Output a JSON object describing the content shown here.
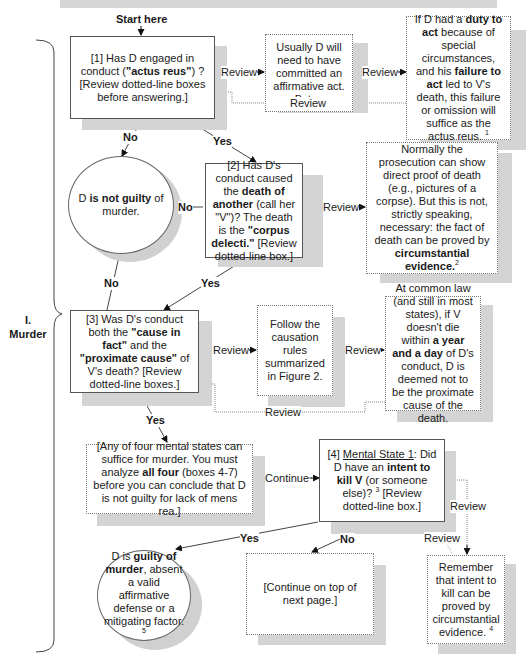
{
  "section": {
    "number": "I.",
    "title": "Murder"
  },
  "start_label": "Start here",
  "nodes": {
    "q1": {
      "pre": "[1] Has D engaged in conduct (",
      "bold": "\"actus reus\"",
      "post": ") ? [Review dotted-line boxes before answering.]"
    },
    "note_affirmative": {
      "text": "Usually D will need to have committed an affirmative act. But ..."
    },
    "note_duty": {
      "t1": "If D had a ",
      "b1": "duty to act",
      "t2": " because of special circumstances, and his ",
      "b2": "failure to act",
      "t3": " led to V's death, this failure or omission will suffice as the actus reus.",
      "footnote": "1"
    },
    "not_guilty": {
      "t1": "D ",
      "b1": "is not guilty",
      "t2": " of murder."
    },
    "q2": {
      "t1": "[2] Has D's conduct caused the ",
      "b1": "death of another",
      "t2": " (call her \"V\")? The death is the ",
      "b2": "\"corpus delecti.\"",
      "t3": "  [Review dotted-line box.]"
    },
    "note_corpus": {
      "t1": "Normally the prosecution can show direct proof of death (e.g., pictures of a corpse). But this is not, strictly speaking, necessary: the fact of death can be proved by ",
      "b1": "circumstantial evidence.",
      "footnote": "2"
    },
    "q3": {
      "t1": "[3] Was D's conduct both the ",
      "b1": "\"cause in fact\"",
      "t2": " and the ",
      "b2": "\"proximate cause\"",
      "t3": " of V's death? [Review dotted-line boxes.]"
    },
    "note_causation": {
      "text": "Follow the causation rules summarized in Figure 2."
    },
    "note_year_day": {
      "t1": "At common law (and still in most states), if V doesn't die within ",
      "b1": "a year and a day",
      "t2": " of D's conduct, D is deemed not to be the proximate cause of the death."
    },
    "note_mental": {
      "t1": "[Any of four mental states can suffice for murder. You must analyze ",
      "b1": "all four",
      "t2": " (boxes 4-7) before you can conclude that D is not guilty for lack of mens rea.]"
    },
    "q4": {
      "t1": "[4] ",
      "u1": "Mental State 1",
      "t2": ": Did D have an ",
      "b1": "intent to kill V",
      "t3": " (or someone else)?",
      "footnote": "3",
      "t4": " [Review dotted-line box.]"
    },
    "guilty": {
      "t1": "D is ",
      "b1": "guilty of murder",
      "t2": ", absent a valid affirmative defense or a mitigating factor.",
      "footnote": "5"
    },
    "continue_next": {
      "text": "[Continue on top of next page.]"
    },
    "note_intent": {
      "text": "Remember that intent to kill can be proved by circumstantial evidence.",
      "footnote": "4"
    }
  },
  "edge_labels": {
    "review": "Review",
    "yes": "Yes",
    "no": "No",
    "continue": "Continue"
  }
}
